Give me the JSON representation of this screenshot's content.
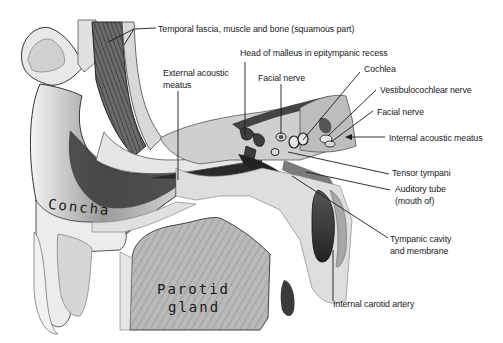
{
  "figure": {
    "background": "#ffffff",
    "line_color": "#1a1a1a",
    "labels": {
      "temporal": "Temporal fascia, muscle and bone (squamous part)",
      "malleus": "Head of malleus in epitympanic recess",
      "ext_meatus_1": "External acoustic",
      "ext_meatus_2": "meatus",
      "facial_nerve_top": "Facial nerve",
      "cochlea": "Cochlea",
      "vestibulocochlear": "Vestibulocochlear nerve",
      "facial_nerve_right": "Facial nerve",
      "int_meatus": "Internal acoustic meatus",
      "tensor": "Tensor tympani",
      "auditory_1": "Auditory tube",
      "auditory_2": "(mouth of)",
      "tympanic_1": "Tympanic cavity",
      "tympanic_2": "and membrane",
      "carotid": "Internal carotid artery"
    },
    "inline_labels": {
      "concha": "Concha",
      "parotid_1": "Parotid",
      "parotid_2": "gland"
    }
  }
}
